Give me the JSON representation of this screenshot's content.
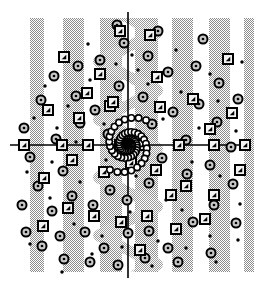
{
  "figure": {
    "title": "",
    "width": 254,
    "height": 288,
    "background_color": "#ffffff"
  },
  "chart_data": {
    "type": "scatter",
    "title": "",
    "xlabel": "",
    "ylabel": "",
    "xlim": [
      -1.0,
      1.0
    ],
    "ylim": [
      -1.0,
      1.0
    ],
    "grid": false,
    "legend": "none",
    "axes": {
      "show_axis_lines": true,
      "axis_color": "#000000",
      "axis_line_width": 1.6,
      "x_axis_y_pixel": 145,
      "y_axis_x_pixel": 128,
      "x_axis_extent_pixels": [
        10,
        245
      ],
      "y_axis_extent_pixels": [
        12,
        278
      ]
    },
    "background_bands": {
      "description": "vertical dithered gray stripes",
      "fill_color": "#a8a8a8",
      "opacity": 0.62,
      "top_pixel": 18,
      "bottom_pixel": 272,
      "stripes_x_ranges": [
        [
          30,
          44
        ],
        [
          63,
          84
        ],
        [
          100,
          122
        ],
        [
          135,
          158
        ],
        [
          172,
          193
        ],
        [
          209,
          230
        ],
        [
          244,
          254
        ]
      ]
    },
    "center_wave": {
      "description": "sinusoidal gray band overlapping the vertical axis",
      "fill_color": "#a8a8a8",
      "opacity": 0.55,
      "center_x_pixel": 128,
      "amplitude_pixels": 22,
      "wavelength_pixels": 58,
      "band_half_width_pixels": 13
    },
    "spiral": {
      "description": "two-arm logarithmic spiral of small open circles",
      "marker": "open-circle",
      "marker_radius_pixels": 3.2,
      "marker_edge_color": "#000000",
      "marker_face_color": "none",
      "center_pixel": [
        128,
        145
      ],
      "arms": 2,
      "turns": 1.85,
      "a": 2.0,
      "b": 0.235,
      "points_per_arm": 46,
      "max_radius_pixels": 56
    },
    "series": [
      {
        "name": "open-circles",
        "marker": "open-circle",
        "marker_size_pixels": 9,
        "edge_color": "#000000",
        "face_color": "#c8c8c8",
        "count": 58,
        "points_pixels": [
          [
            41,
            100
          ],
          [
            76,
            96
          ],
          [
            80,
            123
          ],
          [
            24,
            128
          ],
          [
            30,
            157
          ],
          [
            56,
            139
          ],
          [
            63,
            171
          ],
          [
            95,
            110
          ],
          [
            108,
            134
          ],
          [
            119,
            86
          ],
          [
            143,
            97
          ],
          [
            152,
            124
          ],
          [
            173,
            112
          ],
          [
            186,
            140
          ],
          [
            199,
            104
          ],
          [
            217,
            122
          ],
          [
            231,
            147
          ],
          [
            210,
            165
          ],
          [
            187,
            174
          ],
          [
            162,
            158
          ],
          [
            149,
            183
          ],
          [
            127,
            200
          ],
          [
            110,
            190
          ],
          [
            93,
            205
          ],
          [
            72,
            196
          ],
          [
            52,
            211
          ],
          [
            38,
            186
          ],
          [
            22,
            205
          ],
          [
            60,
            236
          ],
          [
            85,
            232
          ],
          [
            104,
            248
          ],
          [
            128,
            233
          ],
          [
            149,
            231
          ],
          [
            168,
            248
          ],
          [
            193,
            222
          ],
          [
            214,
            205
          ],
          [
            233,
            184
          ],
          [
            236,
            223
          ],
          [
            211,
            253
          ],
          [
            178,
            262
          ],
          [
            145,
            258
          ],
          [
            118,
            265
          ],
          [
            90,
            262
          ],
          [
            64,
            259
          ],
          [
            42,
            246
          ],
          [
            26,
            232
          ],
          [
            168,
            72
          ],
          [
            148,
            56
          ],
          [
            124,
            43
          ],
          [
            100,
            60
          ],
          [
            78,
            66
          ],
          [
            54,
            76
          ],
          [
            196,
            66
          ],
          [
            219,
            83
          ],
          [
            238,
            99
          ],
          [
            203,
            39
          ],
          [
            158,
            31
          ],
          [
            117,
            25
          ]
        ]
      },
      {
        "name": "framed-squares",
        "marker": "framed-square",
        "marker_size_pixels": 10,
        "edge_color": "#000000",
        "face_color": "#f2f2f2",
        "count": 40,
        "points_pixels": [
          [
            48,
            110
          ],
          [
            79,
            118
          ],
          [
            87,
            93
          ],
          [
            110,
            106
          ],
          [
            120,
            31
          ],
          [
            150,
            35
          ],
          [
            113,
            102
          ],
          [
            157,
            77
          ],
          [
            160,
            107
          ],
          [
            193,
            99
          ],
          [
            210,
            129
          ],
          [
            232,
            113
          ],
          [
            245,
            145
          ],
          [
            214,
            145
          ],
          [
            179,
            145
          ],
          [
            142,
            145
          ],
          [
            120,
            145
          ],
          [
            88,
            145
          ],
          [
            62,
            145
          ],
          [
            24,
            145
          ],
          [
            44,
            178
          ],
          [
            72,
            160
          ],
          [
            104,
            172
          ],
          [
            131,
            163
          ],
          [
            156,
            170
          ],
          [
            186,
            186
          ],
          [
            214,
            195
          ],
          [
            240,
            170
          ],
          [
            205,
            219
          ],
          [
            176,
            229
          ],
          [
            147,
            216
          ],
          [
            121,
            222
          ],
          [
            94,
            216
          ],
          [
            68,
            208
          ],
          [
            43,
            226
          ],
          [
            140,
            250
          ],
          [
            171,
            195
          ],
          [
            100,
            74
          ],
          [
            64,
            57
          ],
          [
            228,
            59
          ]
        ]
      },
      {
        "name": "small-dots",
        "marker": "filled-dot",
        "marker_size_pixels": 3.5,
        "edge_color": "#000000",
        "face_color": "#000000",
        "count": 44,
        "points_pixels": [
          [
            45,
            86
          ],
          [
            68,
            106
          ],
          [
            90,
            80
          ],
          [
            104,
            124
          ],
          [
            116,
            64
          ],
          [
            132,
            55
          ],
          [
            148,
            84
          ],
          [
            163,
            119
          ],
          [
            181,
            92
          ],
          [
            199,
            128
          ],
          [
            218,
            101
          ],
          [
            236,
            131
          ],
          [
            34,
            118
          ],
          [
            57,
            128
          ],
          [
            76,
            142
          ],
          [
            27,
            172
          ],
          [
            52,
            162
          ],
          [
            80,
            182
          ],
          [
            106,
            160
          ],
          [
            136,
            176
          ],
          [
            166,
            200
          ],
          [
            192,
            162
          ],
          [
            220,
            176
          ],
          [
            240,
            204
          ],
          [
            210,
            236
          ],
          [
            182,
            210
          ],
          [
            158,
            241
          ],
          [
            130,
            212
          ],
          [
            102,
            236
          ],
          [
            74,
            224
          ],
          [
            50,
            198
          ],
          [
            30,
            244
          ],
          [
            62,
            272
          ],
          [
            92,
            254
          ],
          [
            122,
            247
          ],
          [
            152,
            266
          ],
          [
            186,
            248
          ],
          [
            216,
            262
          ],
          [
            238,
            240
          ],
          [
            88,
            44
          ],
          [
            138,
            70
          ],
          [
            176,
            50
          ],
          [
            210,
            74
          ],
          [
            242,
            62
          ]
        ]
      }
    ]
  }
}
